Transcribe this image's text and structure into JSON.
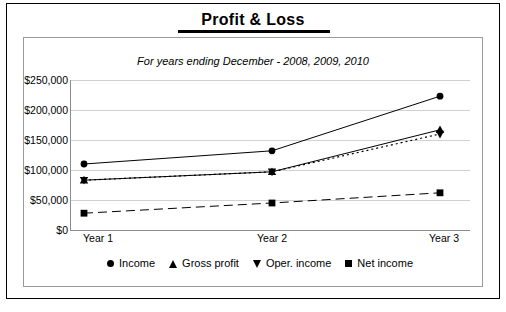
{
  "title": "Profit & Loss",
  "subtitle": "For years ending December - 2008, 2009, 2010",
  "legend": {
    "items": [
      {
        "label": "Income",
        "marker": "circle-marker"
      },
      {
        "label": "Gross profit",
        "marker": "triangle-up-marker"
      },
      {
        "label": "Oper. income",
        "marker": "triangle-down-marker"
      },
      {
        "label": "Net income",
        "marker": "square-marker"
      }
    ]
  },
  "axis": {
    "y_ticks": [
      "$0",
      "$50,000",
      "$100,000",
      "$150,000",
      "$200,000",
      "$250,000"
    ],
    "x_ticks": [
      "Year 1",
      "Year 2",
      "Year 3"
    ]
  },
  "chart_data": {
    "type": "line",
    "title": "Profit & Loss",
    "subtitle": "For years ending December - 2008, 2009, 2010",
    "categories": [
      "Year 1",
      "Year 2",
      "Year 3"
    ],
    "xlabel": "",
    "ylabel": "",
    "ylim": [
      0,
      250000
    ],
    "ytick_values": [
      0,
      50000,
      100000,
      150000,
      200000,
      250000
    ],
    "ytick_labels": [
      "$0",
      "$50,000",
      "$100,000",
      "$150,000",
      "$200,000",
      "$250,000"
    ],
    "grid": true,
    "legend_position": "bottom",
    "series": [
      {
        "name": "Income",
        "marker": "circle",
        "line": "solid",
        "values": [
          110000,
          132000,
          223000
        ]
      },
      {
        "name": "Gross profit",
        "marker": "triangle-up",
        "line": "solid",
        "values": [
          83000,
          97000,
          167000
        ]
      },
      {
        "name": "Oper. income",
        "marker": "triangle-down",
        "line": "dotted",
        "values": [
          83000,
          97000,
          160000
        ]
      },
      {
        "name": "Net income",
        "marker": "square",
        "line": "dashed",
        "values": [
          28000,
          45000,
          62000
        ]
      }
    ]
  },
  "colors": {
    "ink": "#000000",
    "grid": "#d0d0d0",
    "frame": "#9a9a9a",
    "background": "#ffffff"
  }
}
